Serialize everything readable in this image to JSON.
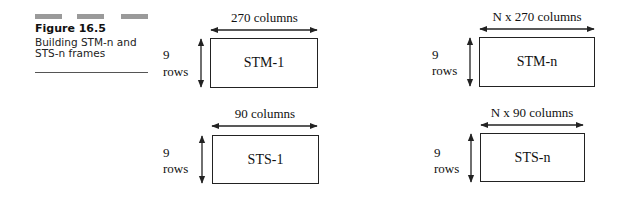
{
  "caption": {
    "figure_label": "Figure 16.5",
    "description": "Building STM-n and STS-n frames"
  },
  "frames": [
    {
      "name": "STM-1",
      "columns_label": "270 columns",
      "rows_num": "9",
      "rows_label": "rows"
    },
    {
      "name": "STM-n",
      "columns_label": "N x 270 columns",
      "rows_num": "9",
      "rows_label": "rows"
    },
    {
      "name": "STS-1",
      "columns_label": "90 columns",
      "rows_num": "9",
      "rows_label": "rows"
    },
    {
      "name": "STS-n",
      "columns_label": "N x 90 columns",
      "rows_num": "9",
      "rows_label": "rows"
    }
  ]
}
